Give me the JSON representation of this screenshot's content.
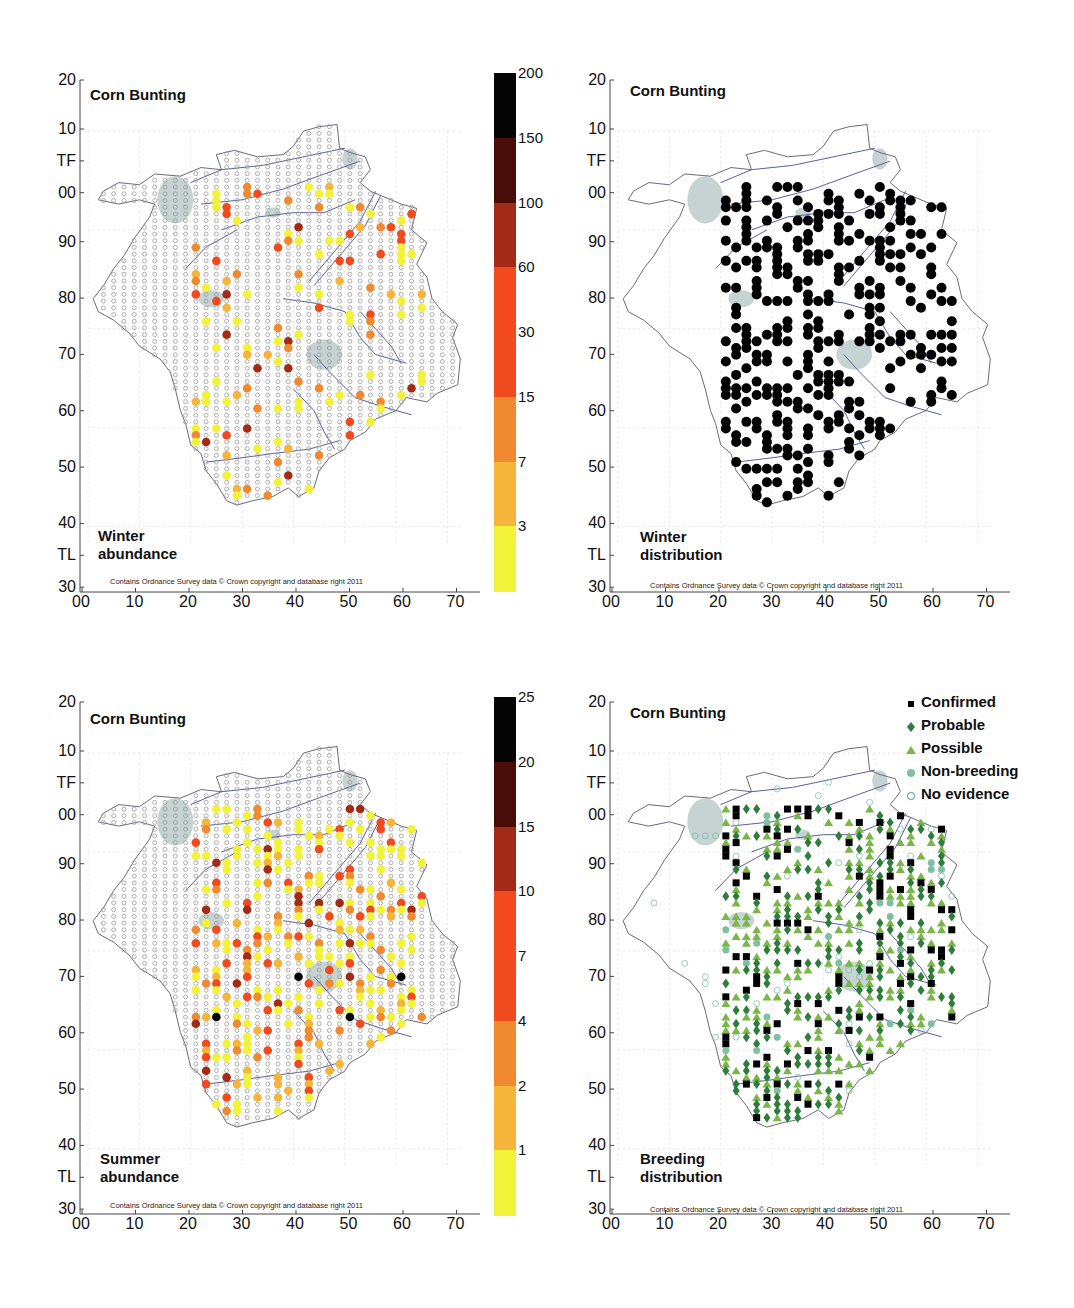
{
  "chart_data": [
    {
      "type": "scatter",
      "panel": "top-left",
      "title": "Corn Bunting",
      "subtitle": "Winter abundance",
      "credit": "Contains Ordnance Survey data © Crown copyright and database right 2011",
      "xlabel": "",
      "ylabel": "",
      "x_ticks": [
        "00",
        "10",
        "20",
        "30",
        "40",
        "50",
        "60",
        "70"
      ],
      "y_ticks": [
        "20",
        "10",
        "TF",
        "00",
        "90",
        "80",
        "70",
        "60",
        "50",
        "40",
        "TL",
        "30"
      ],
      "colorbar": {
        "ticks": [
          "200",
          "150",
          "100",
          "60",
          "30",
          "15",
          "7",
          "3"
        ],
        "bins": [
          {
            "range": "0-3",
            "color": "#f2f23a"
          },
          {
            "range": "3-7",
            "color": "#f5b53a"
          },
          {
            "range": "7-15",
            "color": "#f08a30"
          },
          {
            "range": "15-30",
            "color": "#f04a1e"
          },
          {
            "range": "30-60",
            "color": "#f24a1c"
          },
          {
            "range": "60-100",
            "color": "#a32a14"
          },
          {
            "range": "100-150",
            "color": "#4a0c08"
          },
          {
            "range": "150-200",
            "color": "#050505"
          }
        ]
      },
      "points_note": "Tetrad grid (2km) dots: small grey open circles = surveyed/no birds; filled colored circles = counts per colorbar"
    },
    {
      "type": "scatter",
      "panel": "top-right",
      "title": "Corn Bunting",
      "subtitle": "Winter distribution",
      "credit": "Contains Ordnance Survey data © Crown copyright and database right 2011",
      "x_ticks": [
        "00",
        "10",
        "20",
        "30",
        "40",
        "50",
        "60",
        "70"
      ],
      "y_ticks": [
        "20",
        "10",
        "TF",
        "00",
        "90",
        "80",
        "70",
        "60",
        "50",
        "40",
        "TL",
        "30"
      ],
      "points_note": "Black filled circles = tetrads with winter presence"
    },
    {
      "type": "scatter",
      "panel": "bottom-left",
      "title": "Corn Bunting",
      "subtitle": "Summer abundance",
      "credit": "Contains Ordnance Survey data © Crown copyright and database right 2011",
      "x_ticks": [
        "00",
        "10",
        "20",
        "30",
        "40",
        "50",
        "60",
        "70"
      ],
      "y_ticks": [
        "20",
        "10",
        "TF",
        "00",
        "90",
        "80",
        "70",
        "60",
        "50",
        "40",
        "TL",
        "30"
      ],
      "colorbar": {
        "ticks": [
          "25",
          "20",
          "15",
          "10",
          "7",
          "4",
          "2",
          "1"
        ],
        "bins": [
          {
            "range": "0-1",
            "color": "#f2f23a"
          },
          {
            "range": "1-2",
            "color": "#f5b53a"
          },
          {
            "range": "2-4",
            "color": "#f08a30"
          },
          {
            "range": "4-7",
            "color": "#f04a1e"
          },
          {
            "range": "7-10",
            "color": "#f24a1c"
          },
          {
            "range": "10-15",
            "color": "#a32a14"
          },
          {
            "range": "15-20",
            "color": "#4a0c08"
          },
          {
            "range": "20-25",
            "color": "#050505"
          }
        ]
      }
    },
    {
      "type": "scatter",
      "panel": "bottom-right",
      "title": "Corn Bunting",
      "subtitle": "Breeding distribution",
      "credit": "Contains Ordnance Survey data © Crown copyright and database right 2011",
      "x_ticks": [
        "00",
        "10",
        "20",
        "30",
        "40",
        "50",
        "60",
        "70"
      ],
      "y_ticks": [
        "20",
        "10",
        "TF",
        "00",
        "90",
        "80",
        "70",
        "60",
        "50",
        "40",
        "TL",
        "30"
      ],
      "legend": [
        {
          "label": "Confirmed",
          "marker": "square",
          "color": "#000000"
        },
        {
          "label": "Probable",
          "marker": "diamond",
          "color": "#2e7d3a"
        },
        {
          "label": "Possible",
          "marker": "triangle",
          "color": "#7ab648"
        },
        {
          "label": "Non-breeding",
          "marker": "filled-circle",
          "color": "#7fc0a0"
        },
        {
          "label": "No evidence",
          "marker": "open-circle",
          "color": "#7fc0a0"
        }
      ]
    }
  ],
  "panels": {
    "tl": {
      "title": "Corn Bunting",
      "sublabel": "Winter\nabundance"
    },
    "tr": {
      "title": "Corn Bunting",
      "sublabel": "Winter\ndistribution"
    },
    "bl": {
      "title": "Corn Bunting",
      "sublabel": "Summer\nabundance"
    },
    "br": {
      "title": "Corn Bunting",
      "sublabel": "Breeding\ndistribution"
    }
  },
  "credit": "Contains Ordnance Survey data © Crown copyright and database right 2011",
  "axes": {
    "x": [
      "00",
      "10",
      "20",
      "30",
      "40",
      "50",
      "60",
      "70"
    ],
    "y": [
      "20",
      "10",
      "TF",
      "00",
      "90",
      "80",
      "70",
      "60",
      "50",
      "40",
      "TL",
      "30"
    ]
  },
  "colorbar_winter": {
    "ticks": [
      "200",
      "150",
      "100",
      "60",
      "30",
      "15",
      "7",
      "3"
    ]
  },
  "colorbar_summer": {
    "ticks": [
      "25",
      "20",
      "15",
      "10",
      "7",
      "4",
      "2",
      "1"
    ]
  },
  "colors": {
    "bins": [
      "#f2f23a",
      "#f5b53a",
      "#f08a30",
      "#f04a1e",
      "#f24a1c",
      "#a32a14",
      "#4a0c08",
      "#050505"
    ],
    "river": "#5a5f9e",
    "outline": "#6a6a7a",
    "water": "#c5d3d3",
    "empty_dot": "#9a9a9a"
  },
  "legend": {
    "items": [
      {
        "label": "Confirmed"
      },
      {
        "label": "Probable"
      },
      {
        "label": "Possible"
      },
      {
        "label": "Non-breeding"
      },
      {
        "label": "No evidence"
      }
    ]
  }
}
